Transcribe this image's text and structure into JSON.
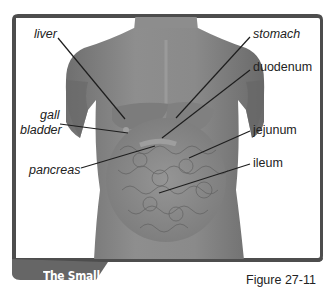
{
  "figure": {
    "title": "The Small Intestines",
    "caption": "Figure 27-11"
  },
  "labels": {
    "liver": "liver",
    "gall": "gall",
    "bladder": "bladder",
    "pancreas": "pancreas",
    "stomach": "stomach",
    "duodenum": "duodenum",
    "jejunum": "jejunum",
    "ileum": "ileum"
  },
  "colors": {
    "frame": "#5a5a5a",
    "banner": "#6b6b6b",
    "body": "#8a8a8a",
    "leader_line": "#1e1e1e"
  }
}
